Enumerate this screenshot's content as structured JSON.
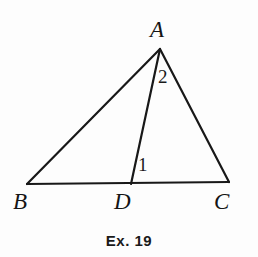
{
  "figure": {
    "caption": "Ex. 19",
    "stroke_color": "#181818",
    "background_color": "#fdfdfd",
    "stroke_width": 2.2,
    "vertices": [
      {
        "name": "A",
        "label": "A",
        "x": 160,
        "y": 49
      },
      {
        "name": "B",
        "label": "B",
        "x": 27,
        "y": 184
      },
      {
        "name": "C",
        "label": "C",
        "x": 229,
        "y": 182
      },
      {
        "name": "D",
        "label": "D",
        "x": 131,
        "y": 184
      }
    ],
    "segments": [
      {
        "name": "segment-AB",
        "from": "A",
        "to": "B"
      },
      {
        "name": "segment-AC",
        "from": "A",
        "to": "C"
      },
      {
        "name": "segment-BC",
        "from": "B",
        "to": "C"
      },
      {
        "name": "segment-AD",
        "from": "A",
        "to": "D"
      }
    ],
    "angle_marks": [
      {
        "name": "angle-1",
        "label": "1",
        "at_vertex": "D",
        "x": 142,
        "y": 163
      },
      {
        "name": "angle-2",
        "label": "2",
        "at_vertex": "A",
        "x": 163,
        "y": 77
      }
    ]
  }
}
